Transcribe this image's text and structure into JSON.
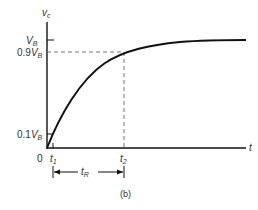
{
  "figure": {
    "caption": "(b)",
    "y_axis_label": "v",
    "y_axis_label_sub": "c",
    "x_axis_label": "t",
    "origin_label": "0",
    "y_ticks": [
      {
        "coef": "",
        "var": "V",
        "sub": "B"
      },
      {
        "coef": "0.9",
        "var": "V",
        "sub": "B"
      },
      {
        "coef": "0.1",
        "var": "V",
        "sub": "B"
      }
    ],
    "x_ticks": [
      {
        "var": "t",
        "sub": "1"
      },
      {
        "var": "t",
        "sub": "2"
      }
    ],
    "interval_label": {
      "var": "t",
      "sub": "R"
    },
    "curve_description": "exponential rise approaching V_B",
    "colors": {
      "ink": "#111111",
      "text": "#333333",
      "dash": "#777777"
    }
  }
}
